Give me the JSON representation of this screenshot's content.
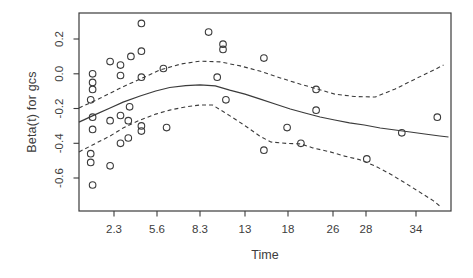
{
  "window": {
    "width": 473,
    "height": 278,
    "background": "#ffffff"
  },
  "style": {
    "stroke_color": "#3b3b3b",
    "text_color": "#3d3d3d",
    "point_radius": 3.3,
    "dash_pattern": "4 3"
  },
  "chart_data": {
    "type": "scatter",
    "title": "",
    "xlabel": "Time",
    "ylabel": "Beta(t) for gcs",
    "grid": false,
    "legend": "none",
    "ylim": [
      -0.79,
      0.35
    ],
    "xlim_time": [
      0.5,
      36.8
    ],
    "x_scale_note": "nonlinear survival-time axis (cox.zph KM-transform); piecewise-linear anchors time->px",
    "x_tick_labels": [
      "2.3",
      "5.6",
      "8.3",
      "13",
      "18",
      "26",
      "28",
      "34"
    ],
    "x_tick_values": [
      2.3,
      5.6,
      8.3,
      13,
      18,
      26,
      28,
      34
    ],
    "y_tick_labels": [
      "0.2",
      "0.0",
      "-0.2",
      "-0.4",
      "-0.6"
    ],
    "y_tick_values": [
      0.2,
      0.0,
      -0.2,
      -0.4,
      -0.6
    ],
    "x_anchors_time": [
      0.5,
      2.3,
      5.6,
      8.3,
      13,
      18,
      26,
      28,
      34,
      36.8
    ],
    "x_anchors_px": [
      79,
      114,
      157,
      200,
      245,
      288,
      333,
      366,
      416,
      451
    ],
    "y_anchor": {
      "beta": 0.2,
      "px": 39,
      "px_per_unit": 173.75
    },
    "plot_box_px": {
      "left": 79,
      "top": 13,
      "right": 451,
      "bottom": 211
    },
    "points_time_beta": [
      [
        1.2,
        0.0
      ],
      [
        1.2,
        -0.05
      ],
      [
        1.2,
        -0.09
      ],
      [
        1.1,
        -0.15
      ],
      [
        1.2,
        -0.25
      ],
      [
        1.2,
        -0.32
      ],
      [
        1.1,
        -0.46
      ],
      [
        1.1,
        -0.51
      ],
      [
        1.2,
        -0.64
      ],
      [
        2.1,
        0.07
      ],
      [
        2.1,
        -0.27
      ],
      [
        2.1,
        -0.53
      ],
      [
        2.8,
        0.05
      ],
      [
        2.8,
        -0.01
      ],
      [
        2.8,
        -0.24
      ],
      [
        2.8,
        -0.4
      ],
      [
        3.6,
        0.1
      ],
      [
        3.5,
        -0.19
      ],
      [
        3.4,
        -0.27
      ],
      [
        3.4,
        -0.37
      ],
      [
        4.4,
        0.29
      ],
      [
        4.4,
        0.13
      ],
      [
        4.4,
        -0.02
      ],
      [
        4.4,
        -0.3
      ],
      [
        4.4,
        -0.33
      ],
      [
        6.0,
        0.03
      ],
      [
        6.2,
        -0.31
      ],
      [
        9.2,
        0.24
      ],
      [
        10.7,
        0.17
      ],
      [
        10.7,
        0.14
      ],
      [
        10.1,
        -0.02
      ],
      [
        11.0,
        -0.15
      ],
      [
        15.2,
        0.09
      ],
      [
        15.2,
        -0.44
      ],
      [
        17.9,
        -0.31
      ],
      [
        20.3,
        -0.4
      ],
      [
        23.0,
        -0.09
      ],
      [
        23.0,
        -0.21
      ],
      [
        28.1,
        -0.49
      ],
      [
        32.3,
        -0.34
      ],
      [
        35.7,
        -0.25
      ]
    ],
    "smooth_line": [
      [
        0.5,
        -0.278
      ],
      [
        1.3,
        -0.237
      ],
      [
        2.1,
        -0.197
      ],
      [
        3.0,
        -0.163
      ],
      [
        4.3,
        -0.128
      ],
      [
        5.5,
        -0.099
      ],
      [
        6.4,
        -0.079
      ],
      [
        7.4,
        -0.068
      ],
      [
        8.3,
        -0.065
      ],
      [
        9.9,
        -0.07
      ],
      [
        11.4,
        -0.094
      ],
      [
        13.0,
        -0.117
      ],
      [
        14.7,
        -0.145
      ],
      [
        16.5,
        -0.174
      ],
      [
        18.4,
        -0.203
      ],
      [
        21.0,
        -0.226
      ],
      [
        23.7,
        -0.249
      ],
      [
        26.1,
        -0.266
      ],
      [
        27.0,
        -0.283
      ],
      [
        27.9,
        -0.295
      ],
      [
        29.7,
        -0.312
      ],
      [
        31.5,
        -0.324
      ],
      [
        33.3,
        -0.335
      ],
      [
        34.7,
        -0.347
      ],
      [
        35.9,
        -0.358
      ],
      [
        36.6,
        -0.364
      ]
    ],
    "upper_ci": [
      [
        0.5,
        -0.197
      ],
      [
        1.6,
        -0.14
      ],
      [
        2.8,
        -0.082
      ],
      [
        4.3,
        -0.03
      ],
      [
        5.8,
        0.022
      ],
      [
        7.1,
        0.056
      ],
      [
        8.3,
        0.073
      ],
      [
        10.4,
        0.068
      ],
      [
        12.5,
        0.045
      ],
      [
        14.7,
        0.016
      ],
      [
        17.1,
        -0.024
      ],
      [
        20.1,
        -0.059
      ],
      [
        23.2,
        -0.088
      ],
      [
        26.1,
        -0.117
      ],
      [
        27.3,
        -0.131
      ],
      [
        29.1,
        -0.134
      ],
      [
        31.5,
        -0.088
      ],
      [
        33.9,
        -0.03
      ],
      [
        35.1,
        0.01
      ],
      [
        36.2,
        0.05
      ]
    ],
    "lower_ci": [
      [
        0.5,
        -0.45
      ],
      [
        1.3,
        -0.404
      ],
      [
        2.1,
        -0.358
      ],
      [
        3.0,
        -0.312
      ],
      [
        4.3,
        -0.266
      ],
      [
        5.5,
        -0.232
      ],
      [
        6.4,
        -0.209
      ],
      [
        7.4,
        -0.191
      ],
      [
        8.3,
        -0.18
      ],
      [
        9.6,
        -0.18
      ],
      [
        10.8,
        -0.22
      ],
      [
        12.1,
        -0.266
      ],
      [
        13.4,
        -0.312
      ],
      [
        14.7,
        -0.358
      ],
      [
        16.0,
        -0.393
      ],
      [
        17.8,
        -0.401
      ],
      [
        20.3,
        -0.404
      ],
      [
        22.4,
        -0.427
      ],
      [
        25.5,
        -0.45
      ],
      [
        26.7,
        -0.474
      ],
      [
        27.6,
        -0.494
      ],
      [
        29.1,
        -0.531
      ],
      [
        30.9,
        -0.577
      ],
      [
        32.7,
        -0.629
      ],
      [
        34.3,
        -0.681
      ],
      [
        35.4,
        -0.732
      ],
      [
        35.9,
        -0.761
      ]
    ]
  }
}
